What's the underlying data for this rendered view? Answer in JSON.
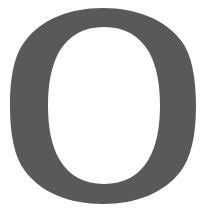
{
  "canvas": {
    "width": 206,
    "height": 212,
    "background_color": "#ffffff"
  },
  "glyph": {
    "character": "O",
    "name": "letter-o-glyph",
    "description": "Capital letter O",
    "style": "serif",
    "fill_color": "#595959",
    "counter_color": "#ffffff",
    "outer": {
      "center_x": 103,
      "center_y": 106,
      "radius_x": 93,
      "radius_y": 98,
      "left": 10,
      "right": 196,
      "top": 8,
      "bottom": 204
    },
    "counter": {
      "center_x": 104,
      "center_y": 105.5,
      "radius_x": 56,
      "radius_y": 78.5,
      "left": 48,
      "right": 160,
      "top": 27,
      "bottom": 184
    },
    "stroke": {
      "side_thickness": 38,
      "top_thickness": 20,
      "bottom_thickness": 20,
      "axis_tilt_degrees": 4
    }
  }
}
